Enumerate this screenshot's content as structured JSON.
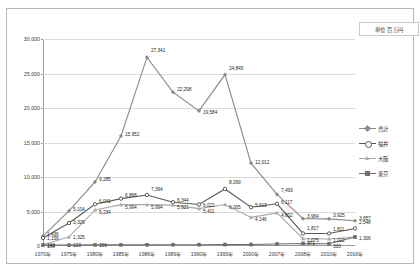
{
  "unit_caption": "単位 百万円",
  "legend": {
    "position": "right",
    "items": [
      {
        "label": "合計",
        "color": "#8a8a8a",
        "marker": "diamond"
      },
      {
        "label": "福井",
        "color": "#5a5a5a",
        "marker": "circle"
      },
      {
        "label": "大阪",
        "color": "#a9a9a9",
        "marker": "triangle"
      },
      {
        "label": "東京",
        "color": "#6e6e6e",
        "marker": "square"
      }
    ]
  },
  "chart_data": {
    "type": "line",
    "title": "",
    "subtitle": "",
    "xlabel": "",
    "ylabel": "",
    "unit": "単位 百万円",
    "ylim": [
      0,
      30000
    ],
    "ytick_labels": [
      "0",
      "5,000",
      "10,000",
      "15,000",
      "20,000",
      "25,000",
      "30,000"
    ],
    "ytick_values": [
      0,
      5000,
      10000,
      15000,
      20000,
      25000,
      30000
    ],
    "grid": true,
    "legend_position": "right",
    "categories": [
      "1970年",
      "1975年",
      "1980年",
      "1985年",
      "1986年",
      "1989年",
      "1990年",
      "1995年",
      "2000年",
      "2007年",
      "2008年",
      "2010年",
      "2016年"
    ],
    "series": [
      {
        "name": "合計",
        "color": "#8a8a8a",
        "values": [
          1436,
          5104,
          9285,
          15952,
          27341,
          22298,
          19584,
          24845,
          12012,
          7493,
          3964,
          3925,
          3657
        ],
        "labels": [
          "1,436",
          "5,104",
          "9,285",
          "15,952",
          "27,341",
          "22,298",
          "19,584",
          "24,845",
          "12,012",
          "7,493",
          "3,964",
          "3,925",
          "3,657"
        ]
      },
      {
        "name": "福井",
        "color": "#5a5a5a",
        "values": [
          1156,
          3329,
          6041,
          6868,
          7394,
          6344,
          6022,
          8269,
          5613,
          6117,
          1817,
          1811,
          2548
        ],
        "labels": [
          "1,156",
          "3,329",
          "6,041",
          "6,868",
          "7,394",
          "6,344",
          "6,022",
          "8,269",
          "5,613",
          "6,117",
          "1,817",
          "1,811",
          "2,548"
        ]
      },
      {
        "name": "大阪",
        "color": "#a9a9a9",
        "values": [
          190,
          1325,
          5234,
          5994,
          5994,
          5921,
          5411,
          6005,
          4146,
          4802,
          1075,
          1022,
          1306
        ],
        "labels": [
          "190",
          "1,325",
          "5,234",
          "5,994",
          "5,994",
          "5,921",
          "5,411",
          "6,005",
          "4,146",
          "4,802",
          "1,075",
          "1,022",
          "1,306"
        ]
      },
      {
        "name": "東京",
        "color": "#6e6e6e",
        "values": [
          143,
          123,
          156,
          160,
          170,
          180,
          190,
          200,
          210,
          300,
          371,
          330,
          1306
        ],
        "labels": [
          "143",
          "123",
          "156",
          "",
          "",
          "",
          "",
          "",
          "",
          "",
          "371",
          "330",
          ""
        ]
      }
    ]
  }
}
